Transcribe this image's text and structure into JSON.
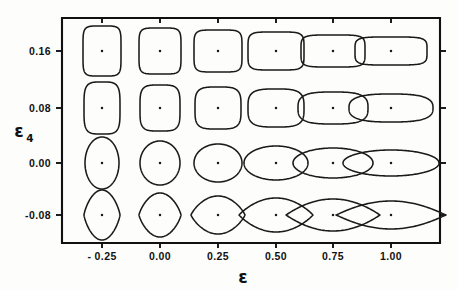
{
  "figure": {
    "name": "nuclear-shape-grid",
    "background_color": "#fdfdfc",
    "line_color": "#1a1a1a"
  },
  "chart_data": {
    "type": "scatter",
    "title": "",
    "subtitle": "",
    "xlabel": "ε",
    "ylabel": "ε₄",
    "xlim": [
      -0.38,
      1.23
    ],
    "ylim": [
      -0.135,
      0.215
    ],
    "grid": false,
    "legend": null,
    "x_ticks": [
      -0.25,
      0.0,
      0.25,
      0.5,
      0.75,
      1.0
    ],
    "x_ticklabels": [
      "- 0.25",
      "0.00",
      "0.25",
      "0.50",
      "0.75",
      "1.00"
    ],
    "y_ticks": [
      0.16,
      0.08,
      0.0,
      -0.08
    ],
    "y_ticklabels": [
      "0.16",
      "0.08",
      "0.00",
      "-0.08"
    ],
    "grid_rows": [
      {
        "eps4": 0.16,
        "row_label": "0.16",
        "cells": [
          {
            "eps": -0.25,
            "rx": 19,
            "ry": 25,
            "squareness": 0.72,
            "neck": 0.0
          },
          {
            "eps": 0.0,
            "rx": 21,
            "ry": 23,
            "squareness": 0.72,
            "neck": 0.0
          },
          {
            "eps": 0.25,
            "rx": 24,
            "ry": 21,
            "squareness": 0.7,
            "neck": 0.0
          },
          {
            "eps": 0.5,
            "rx": 28,
            "ry": 19,
            "squareness": 0.66,
            "neck": 0.0
          },
          {
            "eps": 0.75,
            "rx": 32,
            "ry": 16,
            "squareness": 0.62,
            "neck": 0.0
          },
          {
            "eps": 1.0,
            "rx": 36,
            "ry": 14,
            "squareness": 0.58,
            "neck": 0.0
          }
        ]
      },
      {
        "eps4": 0.08,
        "row_label": "0.08",
        "cells": [
          {
            "eps": -0.25,
            "rx": 18,
            "ry": 26,
            "squareness": 0.42,
            "neck": 0.0
          },
          {
            "eps": 0.0,
            "rx": 20,
            "ry": 23,
            "squareness": 0.42,
            "neck": 0.0
          },
          {
            "eps": 0.25,
            "rx": 23,
            "ry": 21,
            "squareness": 0.38,
            "neck": 0.0
          },
          {
            "eps": 0.5,
            "rx": 28,
            "ry": 19,
            "squareness": 0.3,
            "neck": 0.0
          },
          {
            "eps": 0.75,
            "rx": 35,
            "ry": 16,
            "squareness": 0.22,
            "neck": 0.0
          },
          {
            "eps": 1.0,
            "rx": 42,
            "ry": 14,
            "squareness": 0.16,
            "neck": 0.0
          }
        ]
      },
      {
        "eps4": 0.0,
        "row_label": "0.00",
        "cells": [
          {
            "eps": -0.25,
            "rx": 17,
            "ry": 26,
            "squareness": 0.0,
            "neck": 0.0
          },
          {
            "eps": 0.0,
            "rx": 20,
            "ry": 22,
            "squareness": 0.0,
            "neck": 0.0
          },
          {
            "eps": 0.25,
            "rx": 24,
            "ry": 19,
            "squareness": 0.0,
            "neck": 0.0
          },
          {
            "eps": 0.5,
            "rx": 32,
            "ry": 17,
            "squareness": 0.0,
            "neck": 0.0
          },
          {
            "eps": 0.75,
            "rx": 40,
            "ry": 15,
            "squareness": 0.0,
            "neck": 0.0
          },
          {
            "eps": 1.0,
            "rx": 48,
            "ry": 13,
            "squareness": 0.0,
            "neck": 0.0
          }
        ]
      },
      {
        "eps4": -0.08,
        "row_label": "-0.08",
        "cells": [
          {
            "eps": -0.25,
            "rx": 18,
            "ry": 25,
            "squareness": -0.34,
            "neck": 0.0
          },
          {
            "eps": 0.0,
            "rx": 21,
            "ry": 22,
            "squareness": -0.36,
            "neck": 0.0
          },
          {
            "eps": 0.25,
            "rx": 27,
            "ry": 19,
            "squareness": -0.42,
            "neck": 0.0
          },
          {
            "eps": 0.5,
            "rx": 37,
            "ry": 17,
            "squareness": -0.52,
            "neck": 0.0
          },
          {
            "eps": 0.75,
            "rx": 47,
            "ry": 16,
            "squareness": -0.6,
            "neck": 0.0
          },
          {
            "eps": 1.0,
            "rx": 55,
            "ry": 14,
            "squareness": -0.66,
            "neck": 0.0
          }
        ]
      }
    ]
  },
  "layout": {
    "frame": {
      "left": 62,
      "top": 18,
      "right": 440,
      "bottom": 243
    },
    "column_x": [
      102,
      160,
      218,
      276,
      333,
      391
    ],
    "row_y": [
      51,
      108,
      163,
      215
    ],
    "tick_length": 5,
    "ytick_length": 6
  },
  "axes": {
    "x_title": "ε",
    "y_title_base": "ε",
    "y_title_sub": "4"
  }
}
